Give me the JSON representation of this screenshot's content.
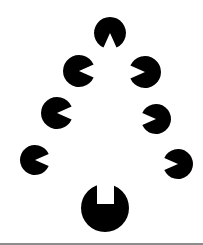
{
  "figure": {
    "ink_color": "#000000",
    "background_color": "#ffffff",
    "rule_color": "#8c8c8c",
    "elements": [
      {
        "name": "top-disc",
        "notch": "wedge",
        "notch_direction": "down"
      },
      {
        "name": "left-disc-row-2",
        "notch": "wedge",
        "notch_direction": "right"
      },
      {
        "name": "right-disc-row-2",
        "notch": "wedge",
        "notch_direction": "left"
      },
      {
        "name": "left-disc-row-3",
        "notch": "wedge",
        "notch_direction": "right"
      },
      {
        "name": "right-disc-row-3",
        "notch": "wedge",
        "notch_direction": "left"
      },
      {
        "name": "left-disc-row-4",
        "notch": "wedge",
        "notch_direction": "right"
      },
      {
        "name": "right-disc-row-4",
        "notch": "wedge",
        "notch_direction": "left"
      },
      {
        "name": "bottom-disc",
        "notch": "rectangular",
        "notch_direction": "up"
      }
    ]
  }
}
